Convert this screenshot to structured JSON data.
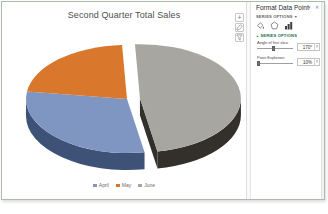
{
  "chart": {
    "title": "Second Quarter Total Sales",
    "side_buttons": [
      {
        "name": "chart-elements",
        "glyph": "+"
      },
      {
        "name": "chart-styles",
        "glyph": "brush"
      },
      {
        "name": "chart-filters",
        "glyph": "funnel"
      }
    ]
  },
  "chart_data": {
    "type": "pie",
    "title": "Second Quarter Total Sales",
    "legend_position": "bottom",
    "start_angle": 170,
    "categories": [
      "April",
      "May",
      "June"
    ],
    "values": [
      30,
      22,
      48
    ],
    "slices": [
      {
        "name": "April",
        "value": 30,
        "color": "#7e96c1",
        "side_color": "#3e5278",
        "exploded": false
      },
      {
        "name": "May",
        "value": 22,
        "color": "#d9772c",
        "side_color": "#8a4a17",
        "exploded": false
      },
      {
        "name": "June",
        "value": 48,
        "color": "#a8a6a1",
        "side_color": "#332f2a",
        "exploded": true
      }
    ],
    "layout": {
      "cx": 125,
      "cy": 77,
      "rx": 101,
      "ry": 54,
      "depth": 17,
      "explode_offset": 13,
      "width": 244,
      "height": 160
    }
  },
  "panel": {
    "title": "Format Data Point",
    "close_glyph": "✕",
    "menu_glyph": "▾",
    "options_header": "SERIES OPTIONS",
    "options_caret": "▼",
    "section": {
      "caret": "▲",
      "label": "SERIES OPTIONS"
    },
    "controls": [
      {
        "label": "Angle of first slice",
        "value": "170°",
        "slider_pct": 47
      },
      {
        "label": "Point Explosion",
        "value": "10%",
        "slider_pct": 3
      }
    ]
  }
}
